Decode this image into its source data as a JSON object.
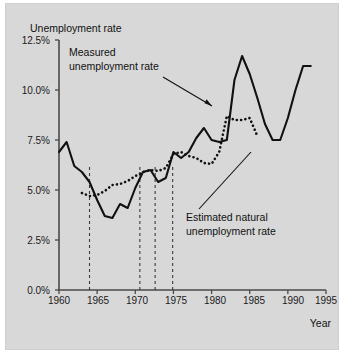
{
  "figure": {
    "background_color": "#d8d8d8",
    "border_color": "#cfcfcf"
  },
  "chart_data": {
    "type": "line",
    "title": "",
    "ylabel": "Unemployment rate",
    "xlabel": "Year",
    "xlim": [
      1960,
      1995
    ],
    "ylim": [
      0,
      12.5
    ],
    "grid": false,
    "legend_position": "annotations-inline",
    "x_ticks": [
      1960,
      1965,
      1970,
      1975,
      1980,
      1985,
      1990,
      1995
    ],
    "x_tick_labels": [
      "1960",
      "1965",
      "1970",
      "1975",
      "1980",
      "1985",
      "1990",
      "1995"
    ],
    "y_ticks": [
      0,
      2.5,
      5.0,
      7.5,
      10.0,
      12.5
    ],
    "y_tick_labels": [
      "0.0%",
      "2.5%",
      "5.0%",
      "7.5%",
      "10.0%",
      "12.5%"
    ],
    "series": [
      {
        "name": "Measured unemployment rate",
        "style": "solid",
        "color": "#111111",
        "x": [
          1960,
          1961,
          1962,
          1963,
          1964,
          1965,
          1966,
          1967,
          1968,
          1969,
          1970,
          1971,
          1972,
          1973,
          1974,
          1975,
          1976,
          1977,
          1978,
          1979,
          1980,
          1981,
          1982,
          1983,
          1984,
          1985,
          1986,
          1987,
          1988,
          1989,
          1990,
          1991,
          1992,
          1993
        ],
        "values": [
          6.9,
          7.4,
          6.2,
          5.9,
          5.4,
          4.5,
          3.7,
          3.6,
          4.3,
          4.1,
          5.1,
          5.9,
          6.0,
          5.4,
          5.6,
          6.9,
          6.6,
          6.9,
          7.6,
          8.1,
          7.5,
          7.4,
          7.5,
          10.5,
          11.7,
          10.8,
          9.6,
          8.3,
          7.5,
          7.5,
          8.6,
          10.0,
          11.2,
          11.2
        ]
      },
      {
        "name": "Estimated natural unemployment rate",
        "style": "dotted",
        "color": "#111111",
        "x": [
          1963,
          1964,
          1965,
          1966,
          1967,
          1968,
          1969,
          1970,
          1971,
          1972,
          1973,
          1974,
          1975,
          1976,
          1977,
          1978,
          1979,
          1980,
          1981,
          1982,
          1983,
          1984,
          1985,
          1986
        ],
        "values": [
          4.85,
          4.7,
          4.75,
          4.95,
          5.25,
          5.3,
          5.45,
          5.7,
          5.9,
          6.0,
          5.95,
          6.1,
          6.8,
          6.9,
          6.7,
          6.6,
          6.35,
          6.3,
          6.9,
          8.7,
          8.5,
          8.5,
          8.6,
          7.7
        ]
      }
    ],
    "recession_markers": [
      1964,
      1970.6,
      1972.6,
      1974.9
    ],
    "annotations": [
      {
        "text_line_1": "Measured",
        "text_line_2": "unemployment rate",
        "target_series": "Measured unemployment rate"
      },
      {
        "text_line_1": "Estimated natural",
        "text_line_2": "unemployment rate",
        "target_series": "Estimated natural unemployment rate"
      }
    ]
  }
}
